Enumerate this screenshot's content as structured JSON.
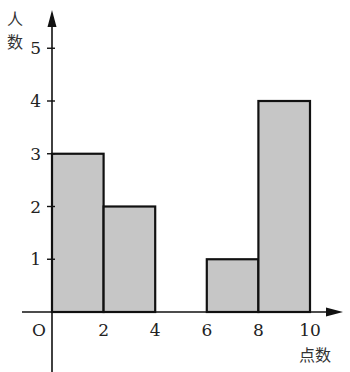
{
  "chart_data": {
    "type": "bar",
    "subtype": "histogram",
    "title": "",
    "xlabel": "点数",
    "ylabel": "人数",
    "origin_label": "O",
    "bins": [
      {
        "from": 0,
        "to": 2,
        "count": 3
      },
      {
        "from": 2,
        "to": 4,
        "count": 2
      },
      {
        "from": 4,
        "to": 6,
        "count": 0
      },
      {
        "from": 6,
        "to": 8,
        "count": 1
      },
      {
        "from": 8,
        "to": 10,
        "count": 4
      }
    ],
    "categories": [
      "0-2",
      "2-4",
      "4-6",
      "6-8",
      "8-10"
    ],
    "values": [
      3,
      2,
      0,
      1,
      4
    ],
    "x_ticks": [
      2,
      4,
      6,
      8,
      10
    ],
    "y_ticks": [
      1,
      2,
      3,
      4,
      5
    ],
    "xlim": [
      0,
      10
    ],
    "ylim": [
      0,
      5
    ],
    "grid": false,
    "legend": null,
    "colors": {
      "bar_fill": "#c6c6c6",
      "bar_stroke": "#111111",
      "axis": "#111111"
    }
  }
}
